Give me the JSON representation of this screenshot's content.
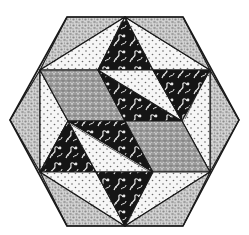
{
  "figure": {
    "colors": {
      "background": "#ffffff",
      "outline": "#1a1a1a",
      "pebble": "#c9c9c9",
      "dotted": "#f4f4f4",
      "gray_rhombus": "#8e8e8e",
      "dark_floral": "#141414",
      "floral_accent": "#e6e6e6",
      "dot": "#6a6a6a"
    },
    "fabrics": [
      "pebble-print",
      "dotted-print",
      "gray-scale-print",
      "black-floral-print"
    ]
  }
}
